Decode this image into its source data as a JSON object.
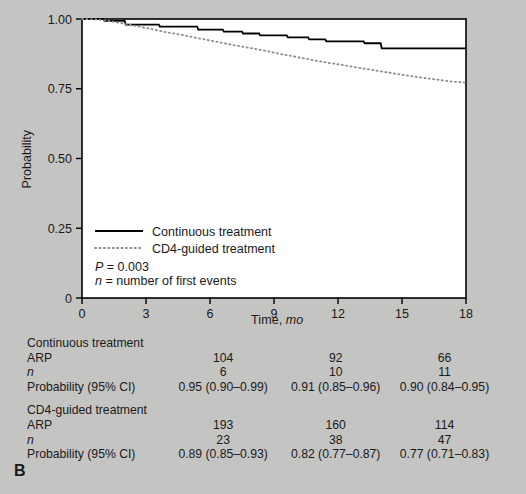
{
  "panel": {
    "label": "B"
  },
  "chart_data": {
    "type": "line",
    "title": "",
    "xlabel_main": "Time, ",
    "xlabel_ital": "mo",
    "ylabel": "Probability",
    "xlim": [
      0,
      18
    ],
    "ylim": [
      0,
      1
    ],
    "xticks": [
      "0",
      "3",
      "6",
      "9",
      "12",
      "15",
      "18"
    ],
    "xtick_values": [
      0,
      3,
      6,
      9,
      12,
      15,
      18
    ],
    "yticks": [
      "0",
      "0.25",
      "0.50",
      "0.75",
      "1.00"
    ],
    "ytick_values": [
      0,
      0.25,
      0.5,
      0.75,
      1.0
    ],
    "grid": false,
    "legend_position": "inside-lower-left",
    "series": [
      {
        "name": "Continuous treatment",
        "style": "solid",
        "color": "#000000",
        "points": [
          [
            0.0,
            1.0
          ],
          [
            1.0,
            1.0
          ],
          [
            1.05,
            0.993
          ],
          [
            2.0,
            0.993
          ],
          [
            2.05,
            0.98
          ],
          [
            3.6,
            0.98
          ],
          [
            3.65,
            0.973
          ],
          [
            5.4,
            0.973
          ],
          [
            5.45,
            0.962
          ],
          [
            6.6,
            0.962
          ],
          [
            6.65,
            0.955
          ],
          [
            7.5,
            0.955
          ],
          [
            7.55,
            0.948
          ],
          [
            8.3,
            0.948
          ],
          [
            8.35,
            0.941
          ],
          [
            9.6,
            0.941
          ],
          [
            9.65,
            0.934
          ],
          [
            10.6,
            0.934
          ],
          [
            10.65,
            0.927
          ],
          [
            11.4,
            0.927
          ],
          [
            11.45,
            0.92
          ],
          [
            13.2,
            0.92
          ],
          [
            13.25,
            0.913
          ],
          [
            14.0,
            0.913
          ],
          [
            14.05,
            0.895
          ],
          [
            18.0,
            0.895
          ]
        ]
      },
      {
        "name": "CD4-guided treatment",
        "style": "dotted",
        "color": "#8c8c8c",
        "points": [
          [
            0.0,
            1.0
          ],
          [
            0.8,
            0.998
          ],
          [
            1.5,
            0.99
          ],
          [
            2.2,
            0.98
          ],
          [
            3.0,
            0.968
          ],
          [
            3.8,
            0.955
          ],
          [
            4.6,
            0.944
          ],
          [
            5.4,
            0.932
          ],
          [
            6.2,
            0.92
          ],
          [
            7.0,
            0.908
          ],
          [
            7.8,
            0.897
          ],
          [
            8.6,
            0.886
          ],
          [
            9.4,
            0.873
          ],
          [
            10.2,
            0.862
          ],
          [
            11.0,
            0.85
          ],
          [
            11.8,
            0.84
          ],
          [
            12.6,
            0.83
          ],
          [
            13.4,
            0.82
          ],
          [
            14.2,
            0.81
          ],
          [
            15.0,
            0.8
          ],
          [
            15.8,
            0.791
          ],
          [
            16.6,
            0.783
          ],
          [
            17.3,
            0.776
          ],
          [
            18.0,
            0.772
          ]
        ]
      }
    ],
    "annotations": {
      "p_value_ital": "P",
      "p_value_text": " = 0.003",
      "n_def_ital": "n",
      "n_def_text": " = number of first events"
    }
  },
  "legend": {
    "items": [
      {
        "label": "Continuous treatment",
        "style": "solid"
      },
      {
        "label": "CD4-guided treatment",
        "style": "dotted"
      }
    ]
  },
  "risk_table": {
    "column_times": [
      "6",
      "12",
      "18"
    ],
    "groups": [
      {
        "name": "Continuous treatment",
        "rows": [
          {
            "label": "ARP",
            "italic": false,
            "values": [
              "104",
              "92",
              "66"
            ]
          },
          {
            "label": "n",
            "italic": true,
            "values": [
              "6",
              "10",
              "11"
            ]
          },
          {
            "label": "Probability (95% CI)",
            "italic": false,
            "values": [
              "0.95 (0.90–0.99)",
              "0.91 (0.85–0.96)",
              "0.90 (0.84–0.95)"
            ]
          }
        ]
      },
      {
        "name": "CD4-guided treatment",
        "rows": [
          {
            "label": "ARP",
            "italic": false,
            "values": [
              "193",
              "160",
              "114"
            ]
          },
          {
            "label": "n",
            "italic": true,
            "values": [
              "23",
              "38",
              "47"
            ]
          },
          {
            "label": "Probability (95% CI)",
            "italic": false,
            "values": [
              "0.89 (0.85–0.93)",
              "0.82 (0.77–0.87)",
              "0.77 (0.71–0.83)"
            ]
          }
        ]
      }
    ]
  },
  "colors": {
    "background": "#c4c4c3",
    "plot_background": "#ffffff",
    "axis": "#000000",
    "solid_series": "#000000",
    "dotted_series": "#8c8c8c"
  }
}
